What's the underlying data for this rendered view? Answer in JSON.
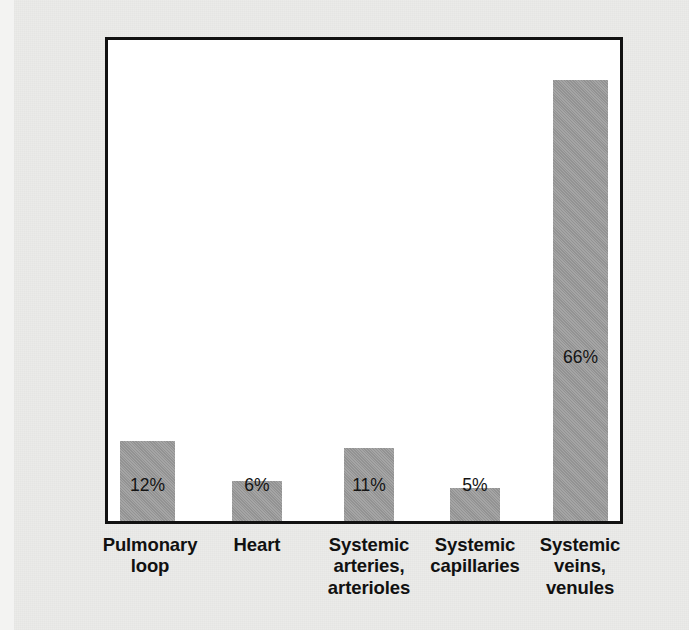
{
  "figure": {
    "background_color": "#ebebe9",
    "plot_background_color": "#ffffff",
    "frame_color": "#111111",
    "bar_color": "#9b9b9b",
    "text_color": "#111111"
  },
  "axes": {
    "y_title": "Percent of total blood volume",
    "x_title": ""
  },
  "chart_data": {
    "type": "bar",
    "title": "",
    "subtitle": "",
    "xlabel": "",
    "ylabel": "Percent of total blood volume",
    "ylim": [
      0,
      72
    ],
    "grid": false,
    "legend": "none",
    "y_tick_labels": [],
    "x_tick_labels": [
      "Pulmonary loop",
      "Heart",
      "Systemic arteries, arterioles",
      "Systemic capillaries",
      "Systemic veins, venules"
    ],
    "categories": [
      "Pulmonary loop",
      "Heart",
      "Systemic arteries, arterioles",
      "Systemic capillaries",
      "Systemic veins, venules"
    ],
    "values": [
      12,
      6,
      11,
      5,
      66
    ],
    "value_labels": [
      "12%",
      "6%",
      "11%",
      "5%",
      "66%"
    ],
    "units": "percent"
  },
  "bars": [
    {
      "category": "Pulmonary loop",
      "value": 12,
      "value_label": "12%",
      "label_lines": [
        "Pulmonary",
        "loop"
      ]
    },
    {
      "category": "Heart",
      "value": 6,
      "value_label": "6%",
      "label_lines": [
        "Heart"
      ]
    },
    {
      "category": "Systemic arteries, arterioles",
      "value": 11,
      "value_label": "11%",
      "label_lines": [
        "Systemic",
        "arteries,",
        "arterioles"
      ]
    },
    {
      "category": "Systemic capillaries",
      "value": 5,
      "value_label": "5%",
      "label_lines": [
        "Systemic",
        "capillaries"
      ]
    },
    {
      "category": "Systemic veins, venules",
      "value": 66,
      "value_label": "66%",
      "label_lines": [
        "Systemic",
        "veins,",
        "venules"
      ]
    }
  ]
}
